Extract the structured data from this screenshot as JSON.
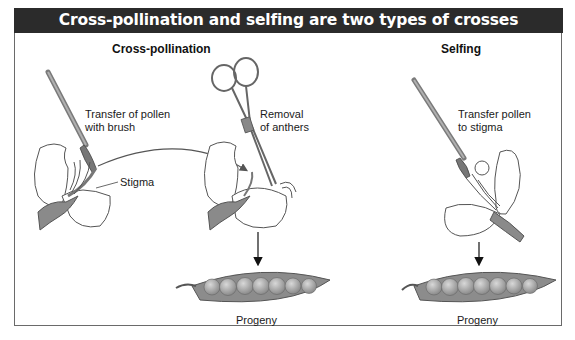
{
  "header": {
    "title": "Cross-pollination and selfing are two types of crosses"
  },
  "panels": {
    "cross_pollination": {
      "title": "Cross-pollination",
      "labels": {
        "brush": "Transfer of pollen\nwith brush",
        "stigma": "Stigma",
        "anthers": "Removal\nof anthers",
        "progeny": "Progeny"
      }
    },
    "selfing": {
      "title": "Selfing",
      "labels": {
        "brush": "Transfer pollen\nto stigma",
        "progeny": "Progeny"
      }
    }
  },
  "colors": {
    "header_bg": "#2b2b2b",
    "header_text": "#ffffff",
    "pod_fill": "#8c8c8c",
    "pea_fill": "#a8a8a8",
    "outline": "#555555"
  },
  "icons": [
    "paintbrush-icon",
    "scissors-icon",
    "flower-icon",
    "pea-pod-icon",
    "arrow-down-icon",
    "curved-arrow-icon"
  ]
}
